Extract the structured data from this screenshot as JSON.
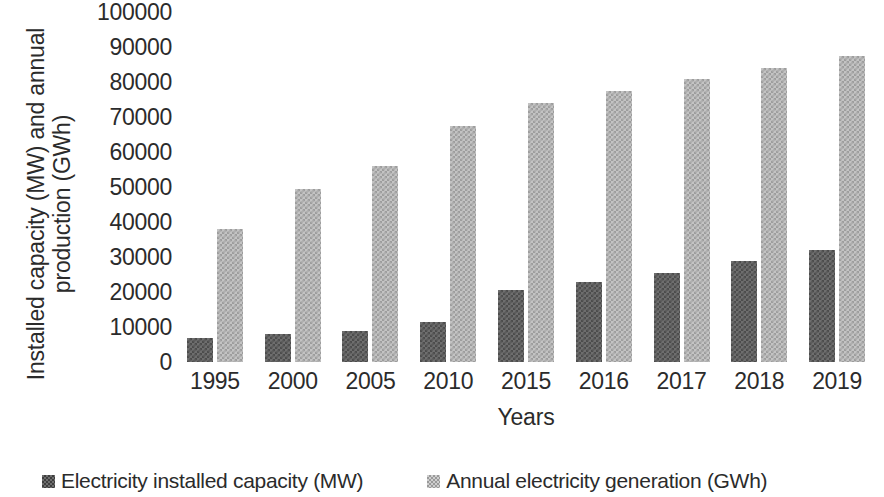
{
  "chart_data": {
    "type": "bar",
    "title": "",
    "xlabel": "Years",
    "ylabel": "Installed capacity (MW) and annual production (GWh)",
    "ylabel_lines": [
      "Installed capacity (MW) and annual",
      "production (GWh)"
    ],
    "categories": [
      "1995",
      "2000",
      "2005",
      "2010",
      "2015",
      "2016",
      "2017",
      "2018",
      "2019"
    ],
    "series": [
      {
        "name": "Electricity installed capacity (MW)",
        "color": "#6e6e6e",
        "values": [
          7000,
          8000,
          9000,
          11500,
          20500,
          23000,
          25500,
          29000,
          32000
        ]
      },
      {
        "name": "Annual electricity generation (GWh)",
        "color": "#c3c3c3",
        "values": [
          38000,
          49500,
          56000,
          67500,
          74000,
          77500,
          81000,
          84000,
          87500
        ]
      }
    ],
    "ylim": [
      0,
      100000
    ],
    "ytick_values": [
      0,
      10000,
      20000,
      30000,
      40000,
      50000,
      60000,
      70000,
      80000,
      90000,
      100000
    ],
    "ytick_labels": [
      "0",
      "10000",
      "20000",
      "30000",
      "40000",
      "50000",
      "60000",
      "70000",
      "80000",
      "90000",
      "100000"
    ],
    "grid": false,
    "legend_position": "bottom"
  },
  "legend": {
    "entries": [
      {
        "label": "Electricity installed capacity (MW)"
      },
      {
        "label": "Annual electricity generation (GWh)"
      }
    ]
  }
}
